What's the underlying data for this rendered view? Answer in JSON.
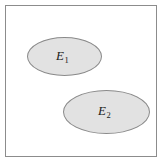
{
  "diagram": {
    "type": "venn-set-diagram",
    "title": "",
    "universe": {
      "name": "sample-space-rectangle",
      "fill_color": "#ffffff",
      "border_color": "#8c8c8c"
    },
    "sets": [
      {
        "id": "E1",
        "base": "E",
        "subscript": "1",
        "fill_color": "#e2e2e2",
        "border_color": "#8a8a8a",
        "shape": "ellipse"
      },
      {
        "id": "E2",
        "base": "E",
        "subscript": "2",
        "fill_color": "#e2e2e2",
        "border_color": "#8a8a8a",
        "shape": "ellipse"
      }
    ],
    "relationship": "disjoint"
  }
}
